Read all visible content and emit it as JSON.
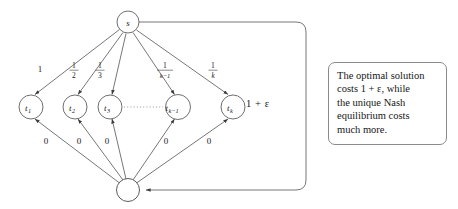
{
  "figure": {
    "kind": "directed-graph-diagram",
    "source_node": {
      "id": "s",
      "label": "s"
    },
    "sink_node": {
      "id": "bottom",
      "label": ""
    },
    "middle_nodes": [
      {
        "id": "t1",
        "label": "t",
        "sub": "1"
      },
      {
        "id": "t2",
        "label": "t",
        "sub": "2"
      },
      {
        "id": "t3",
        "label": "t",
        "sub": "3"
      },
      {
        "id": "tk-1",
        "label": "t",
        "sub": "k−1"
      },
      {
        "id": "tk",
        "label": "t",
        "sub": "k"
      }
    ],
    "dots_between": "· · · · · · · ·",
    "top_edge_labels": [
      {
        "text": "1",
        "numerator": "1",
        "denominator": ""
      },
      {
        "text": "1/2",
        "numerator": "1",
        "denominator": "2"
      },
      {
        "text": "1/3",
        "numerator": "1",
        "denominator": "3"
      },
      {
        "text": "1/(k-1)",
        "numerator": "1",
        "denominator": "k−1"
      },
      {
        "text": "1/k",
        "numerator": "1",
        "denominator": "k"
      }
    ],
    "bottom_edge_labels": [
      "0",
      "0",
      "0",
      "0",
      "0"
    ],
    "loop_edge_label": "1 + ε",
    "colors": {
      "stroke": "#4a4a4a",
      "text": "#1a1a1a",
      "callout_border": "#8a8a8a",
      "background": "#ffffff"
    }
  },
  "callout": {
    "lines": [
      "The optimal solution",
      "costs 1 + ε, while",
      "the unique Nash",
      "equilibrium costs",
      "much more."
    ]
  }
}
